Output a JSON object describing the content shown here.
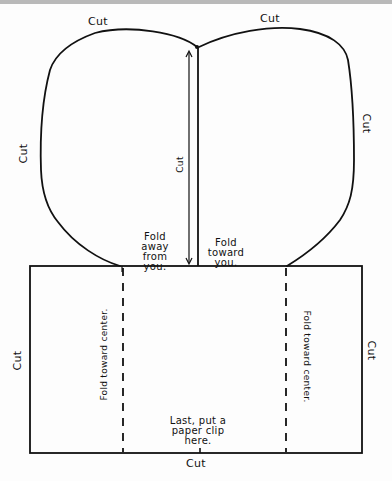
{
  "diagram": {
    "type": "paper-craft template (hand-drawn)",
    "colors": {
      "ink": "#111111",
      "paper": "#fdfdfd",
      "top_bar": "#b9b9b9"
    },
    "lobes": {
      "left_top_label": "Cut",
      "right_top_label": "Cut",
      "left_side_label": "Cut",
      "right_side_label": "Cut",
      "center_cut_label": "Cut",
      "fold_left_label": "Fold\naway\nfrom\nyou.",
      "fold_right_label": "Fold\ntoward\nyou."
    },
    "base_rectangle": {
      "left_side_label": "Cut",
      "right_side_label": "Cut",
      "bottom_label": "Cut",
      "left_fold_label": "Fold toward center.",
      "right_fold_label": "Fold toward center.",
      "paper_clip_note": "Last, put a\npaper clip\nhere."
    }
  }
}
